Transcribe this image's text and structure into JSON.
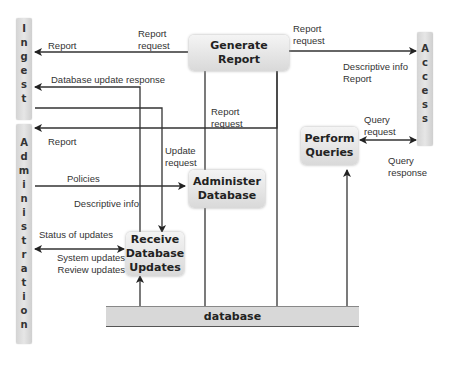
{
  "entities": {
    "ingest": {
      "label": "Ingest",
      "letters": [
        "I",
        "n",
        "g",
        "e",
        "s",
        "t"
      ]
    },
    "administration": {
      "label": "Administration",
      "letters": [
        "A",
        "d",
        "m",
        "i",
        "n",
        "i",
        "s",
        "t",
        "r",
        "a",
        "t",
        "i",
        "o",
        "n"
      ]
    },
    "access": {
      "label": "Access",
      "letters": [
        "A",
        "c",
        "c",
        "e",
        "s",
        "s"
      ]
    }
  },
  "processes": {
    "generate_report": {
      "lines": [
        "Generate Report"
      ]
    },
    "administer_database": {
      "lines": [
        "Administer",
        "Database"
      ]
    },
    "receive_database_updates": {
      "lines": [
        "Receive",
        "Database",
        "Updates"
      ]
    },
    "perform_queries": {
      "lines": [
        "Perform",
        "Queries"
      ]
    }
  },
  "data_store": {
    "label": "database"
  },
  "flows": {
    "ingest_report": "Report",
    "ingest_report_request": [
      "Report",
      "request"
    ],
    "ingest_db_update_response": "Database update response",
    "access_report_request": [
      "Report",
      "request"
    ],
    "access_descriptive_info": [
      "Descriptive info",
      "Report"
    ],
    "admin_report_request": [
      "Report",
      "request"
    ],
    "admin_report": "Report",
    "update_request": [
      "Update",
      "request"
    ],
    "policies": "Policies",
    "descriptive_info": "Descriptive info",
    "status_of_updates": "Status of updates",
    "system_review_updates": [
      "System updates",
      "Review updates"
    ],
    "query_request": [
      "Query",
      "request"
    ],
    "query_response": [
      "Query",
      "response"
    ]
  }
}
